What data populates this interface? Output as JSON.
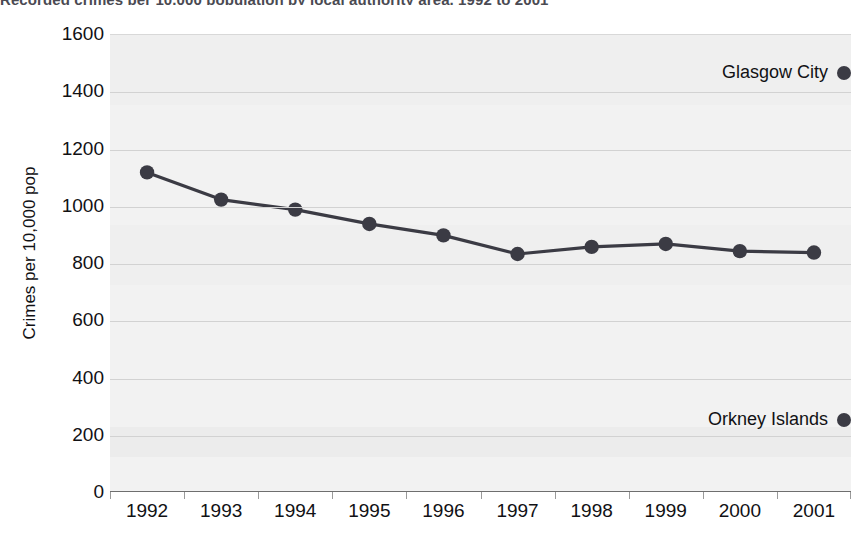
{
  "chart_data": {
    "type": "line",
    "title": "Recorded crimes per 10,000 population by local authority area, 1992 to 2001",
    "xlabel": "",
    "ylabel": "Crimes per 10,000 pop",
    "categories": [
      "1992",
      "1993",
      "1994",
      "1995",
      "1996",
      "1997",
      "1998",
      "1999",
      "2000",
      "2001"
    ],
    "ylim": [
      0,
      1600
    ],
    "ytick_step": 200,
    "yticks": [
      "1600",
      "1400",
      "1200",
      "1000",
      "800",
      "600",
      "400",
      "200",
      "0"
    ],
    "ytick_values": [
      1600,
      1400,
      1200,
      1000,
      800,
      600,
      400,
      200,
      0
    ],
    "grid": true,
    "legend_position": "right-inside",
    "series": [
      {
        "name": "Glasgow City",
        "color": "#3b3b44",
        "marker": "circle",
        "values": [
          1120,
          1025,
          990,
          940,
          900,
          835,
          860,
          870,
          845,
          840
        ]
      },
      {
        "name": "Orkney Islands",
        "color": "#3b3b44",
        "marker": "circle",
        "values": [
          205,
          205,
          205,
          205,
          205,
          205,
          205,
          205,
          205,
          205
        ],
        "line_visible": false,
        "note": "Only legend marker visible; series line lies at bottom of plot"
      }
    ],
    "annotations": [
      {
        "name": "glasgow-city-label",
        "text": "Glasgow City",
        "value": 1410
      },
      {
        "name": "orkney-islands-label",
        "text": "Orkney Islands",
        "value": 205
      }
    ]
  },
  "legend": {
    "glasgow": "Glasgow City",
    "orkney": "Orkney Islands"
  },
  "axis": {
    "y_title": "Crimes per 10,000 pop"
  },
  "colors": {
    "series": "#3b3b44",
    "plot_bg": "#f2f2f2",
    "gridline": "#d2d2d2",
    "text": "#111114"
  }
}
